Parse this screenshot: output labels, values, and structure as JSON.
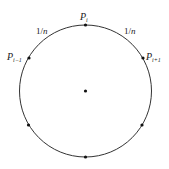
{
  "figure": {
    "type": "circle-partition-diagram",
    "circle": {
      "cx": 85.5,
      "cy": 91,
      "r": 66,
      "stroke": "#333333"
    },
    "center_point": {
      "x": 85.5,
      "y": 91
    },
    "points": [
      {
        "id": "P_i",
        "x": 85.5,
        "y": 25,
        "label_main": "P",
        "label_sub": "i",
        "label_x": 80,
        "label_y": 20
      },
      {
        "id": "P_i+1",
        "x": 143,
        "y": 58,
        "label_main": "P",
        "label_sub": "i+1",
        "label_x": 146,
        "label_y": 60
      },
      {
        "id": "P_i-1",
        "x": 29,
        "y": 58,
        "label_main": "P",
        "label_sub": "i−1",
        "label_x": 7,
        "label_y": 60
      },
      {
        "id": "lower-right",
        "x": 142,
        "y": 125
      },
      {
        "id": "lower-left",
        "x": 28.5,
        "y": 125
      },
      {
        "id": "bottom",
        "x": 85.5,
        "y": 157
      }
    ],
    "arc_labels": [
      {
        "text_num": "1/",
        "text_var": "n",
        "x": 36,
        "y": 34
      },
      {
        "text_num": "1/",
        "text_var": "n",
        "x": 124,
        "y": 34
      }
    ]
  }
}
